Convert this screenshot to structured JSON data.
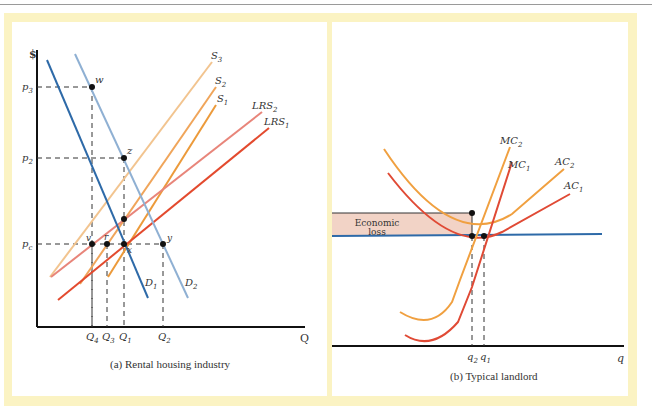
{
  "panels": [
    {
      "id": "a",
      "caption": "(a) Rental housing industry",
      "y_axis_label": "$",
      "x_axis_label": "Q",
      "price_labels": [
        "p3",
        "p2",
        "pc"
      ],
      "quantity_labels": [
        "Q4",
        "Q3",
        "Q1",
        "Q2"
      ],
      "curves": [
        "D1",
        "D2",
        "S1",
        "S2",
        "S3",
        "LRS1",
        "LRS2"
      ],
      "points": [
        "w",
        "z",
        "v",
        "r",
        "x",
        "y"
      ]
    },
    {
      "id": "b",
      "caption": "(b) Typical landlord",
      "y_axis_label": "$",
      "x_axis_label": "q",
      "price_labels": [
        "pc"
      ],
      "quantity_labels": [
        "q2",
        "q1"
      ],
      "curves": [
        "MC1",
        "MC2",
        "AC1",
        "AC2"
      ],
      "shaded_region_label_line1": "Economic",
      "shaded_region_label_line2": "loss"
    }
  ],
  "text": {
    "a_caption": "(a) Rental housing industry",
    "b_caption": "(b) Typical landlord",
    "dollar": "$",
    "Q": "Q",
    "q": "q",
    "loss1": "Economic",
    "loss2": "loss"
  },
  "colors": {
    "frame": "#fbf3c3",
    "demand1": "#2e6aa8",
    "demand2": "#8fb0d3",
    "s3": "#f2c48f",
    "s2": "#f0a55a",
    "s1": "#ec9a3a",
    "lrs2": "#e8857a",
    "lrs1": "#e34a2e",
    "mc_ac_2": "#f0a040",
    "mc_ac_1": "#e04a35",
    "price_line": "#2e6aa8",
    "loss_fill": "#f2d3c6"
  }
}
